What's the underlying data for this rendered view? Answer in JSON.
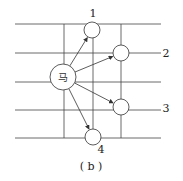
{
  "diagram": {
    "caption": "( b )",
    "center_piece": {
      "label": "马",
      "cx": 63,
      "cy": 77,
      "r": 13
    },
    "grid": {
      "horizontal_lines": [
        24,
        53,
        82,
        110,
        138
      ],
      "vertical_lines": [
        64,
        93,
        121
      ],
      "x_start": 15,
      "x_end": 161,
      "y_start": 24,
      "y_end": 138
    },
    "targets": [
      {
        "label": "1",
        "cx": 92,
        "cy": 30,
        "r": 8,
        "label_x": 93,
        "label_y": 17
      },
      {
        "label": "2",
        "cx": 121,
        "cy": 53,
        "r": 8,
        "label_x": 166,
        "label_y": 57
      },
      {
        "label": "3",
        "cx": 121,
        "cy": 107,
        "r": 8,
        "label_x": 166,
        "label_y": 112
      },
      {
        "label": "4",
        "cx": 93,
        "cy": 137,
        "r": 8,
        "label_x": 101,
        "label_y": 153
      }
    ],
    "line_color": "#333333"
  }
}
